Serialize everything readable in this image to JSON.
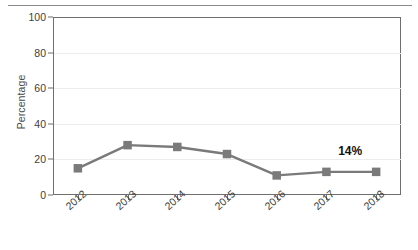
{
  "chart_data": {
    "type": "line",
    "title": "",
    "xlabel": "",
    "ylabel": "Percentage",
    "categories": [
      "2012",
      "2013",
      "2014",
      "2015",
      "2016",
      "2017",
      "2018"
    ],
    "values": [
      15,
      28,
      27,
      23,
      11,
      13,
      13
    ],
    "series": [
      {
        "name": "Percentage",
        "values": [
          15,
          28,
          27,
          23,
          11,
          13,
          13
        ]
      }
    ],
    "ylim": [
      0,
      100
    ],
    "yticks": [
      0,
      20,
      40,
      60,
      80,
      100
    ],
    "ytick_labels": [
      "0",
      "20",
      "40",
      "60",
      "80",
      "100"
    ],
    "grid": true,
    "legend": false,
    "legend_position": "none",
    "marker": "square",
    "line_color": "#7a7a7a",
    "marker_color": "#7a7a7a",
    "grid_color": "#ececec",
    "axis_color": "#6f6f6f",
    "annotations": [
      {
        "text": "14%",
        "x_category": "2018",
        "value": 14
      }
    ]
  }
}
